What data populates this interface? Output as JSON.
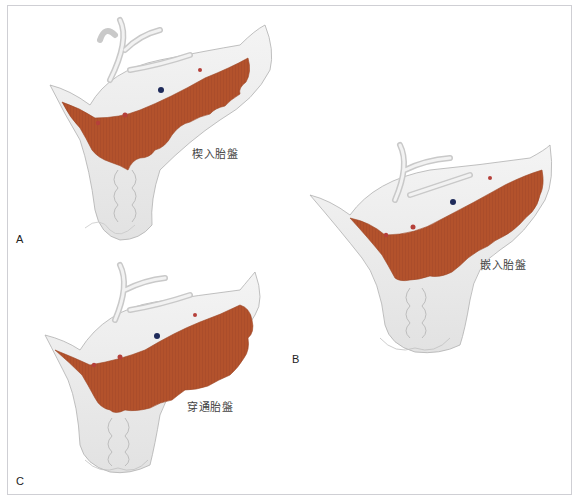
{
  "figure": {
    "panels": [
      {
        "letter": "A",
        "label": "楔入胎盤",
        "type": "placenta accreta"
      },
      {
        "letter": "B",
        "label": "嵌入胎盤",
        "type": "placenta increta"
      },
      {
        "letter": "C",
        "label": "穿通胎盤",
        "type": "placenta percreta"
      }
    ],
    "signature": "Gena",
    "colors": {
      "placenta": "#b3522c",
      "placenta_dark": "#9c4423",
      "uterus": "#ececec",
      "uterus_shade": "#d6d6d6",
      "outline": "#a8a8a8",
      "frame": "#cfcfd4",
      "vessel_red": "#b5403a",
      "vessel_blue": "#1e2a5a"
    }
  }
}
